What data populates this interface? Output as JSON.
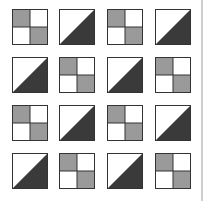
{
  "diagram": {
    "title": "",
    "rows": 4,
    "cols": 4,
    "colors": {
      "outline": "#333333",
      "light_fill": "#9a9a9a",
      "dark_fill": "#3a3a3a",
      "background": "#ffffff",
      "right_rule": "#cfcfcf"
    },
    "tiles": [
      [
        "checker",
        "diagonal",
        "checker",
        "diagonal"
      ],
      [
        "diagonal",
        "checker",
        "diagonal",
        "checker"
      ],
      [
        "checker",
        "diagonal",
        "checker",
        "diagonal"
      ],
      [
        "diagonal",
        "checker",
        "diagonal",
        "checker"
      ]
    ]
  }
}
